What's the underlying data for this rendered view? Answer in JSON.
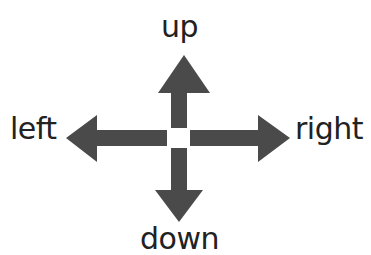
{
  "diagram": {
    "labels": {
      "up": "up",
      "down": "down",
      "left": "left",
      "right": "right"
    },
    "arrow_color": "#4a4a4a",
    "text_color": "#222222"
  }
}
